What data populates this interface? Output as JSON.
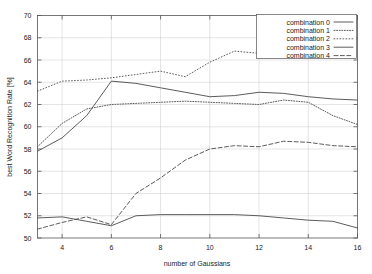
{
  "chart_data": {
    "type": "line",
    "title": "",
    "xlabel": "number of Gaussians",
    "ylabel": "best Word Recognition Rate [%]",
    "xlim": [
      3,
      16
    ],
    "ylim": [
      50,
      70
    ],
    "xticks": [
      4,
      6,
      8,
      10,
      12,
      14,
      16
    ],
    "yticks": [
      50,
      52,
      54,
      56,
      58,
      60,
      62,
      64,
      66,
      68,
      70
    ],
    "grid": true,
    "legend_position": "top-right",
    "x": [
      3,
      4,
      5,
      6,
      7,
      8,
      9,
      10,
      11,
      12,
      13,
      14,
      15,
      16
    ],
    "series": [
      {
        "name": "combination 0",
        "style": "solid",
        "values": [
          57.8,
          59.0,
          61.0,
          64.1,
          63.9,
          63.5,
          63.1,
          62.7,
          62.8,
          63.1,
          63.0,
          62.7,
          62.5,
          62.4
        ]
      },
      {
        "name": "combination 1",
        "style": "fine-dotted",
        "values": [
          58.2,
          60.3,
          61.6,
          62.0,
          62.1,
          62.2,
          62.3,
          62.2,
          62.1,
          62.0,
          62.4,
          62.2,
          61.0,
          60.2
        ]
      },
      {
        "name": "combination 2",
        "style": "dotted",
        "values": [
          63.2,
          64.1,
          64.2,
          64.4,
          64.7,
          65.0,
          64.5,
          65.8,
          66.8,
          66.6,
          66.4,
          66.3,
          66.3,
          66.2
        ]
      },
      {
        "name": "combination 3",
        "style": "thin-solid",
        "values": [
          51.8,
          51.9,
          51.5,
          51.1,
          52.0,
          52.1,
          52.1,
          52.1,
          52.1,
          52.0,
          51.8,
          51.6,
          51.5,
          50.9
        ]
      },
      {
        "name": "combination 4",
        "style": "dashed",
        "values": [
          50.8,
          51.4,
          51.9,
          51.2,
          54.0,
          55.4,
          57.0,
          58.0,
          58.3,
          58.2,
          58.7,
          58.6,
          58.3,
          58.2
        ]
      }
    ]
  },
  "legend": {
    "entries": [
      {
        "label": "combination 0"
      },
      {
        "label": "combination 1"
      },
      {
        "label": "combination 2"
      },
      {
        "label": "combination 3"
      },
      {
        "label": "combination 4"
      }
    ]
  }
}
